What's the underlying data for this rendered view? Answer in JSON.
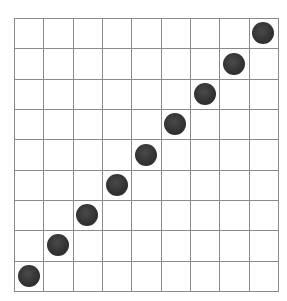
{
  "grid": {
    "columns": 9,
    "rows": 9,
    "line_color": "#8a8a8a",
    "background": "#ffffff"
  },
  "pieces": {
    "color": "#333333",
    "shape": "filled-circle",
    "positions": [
      {
        "col": 0,
        "row": 8
      },
      {
        "col": 1,
        "row": 7
      },
      {
        "col": 2,
        "row": 6
      },
      {
        "col": 3,
        "row": 5
      },
      {
        "col": 4,
        "row": 4
      },
      {
        "col": 5,
        "row": 3
      },
      {
        "col": 6,
        "row": 2
      },
      {
        "col": 7,
        "row": 1
      },
      {
        "col": 8,
        "row": 0
      }
    ]
  }
}
